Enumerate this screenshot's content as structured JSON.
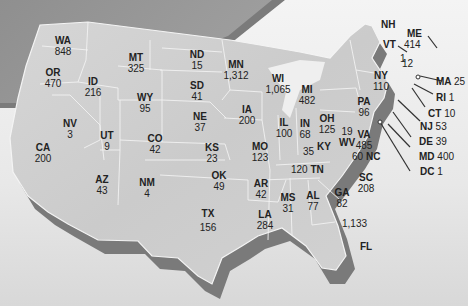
{
  "map": {
    "type": "US state choropleth-style labeled map",
    "states": [
      {
        "abbr": "WA",
        "value": "848"
      },
      {
        "abbr": "OR",
        "value": "470"
      },
      {
        "abbr": "CA",
        "value": "200"
      },
      {
        "abbr": "ID",
        "value": "216"
      },
      {
        "abbr": "NV",
        "value": "3"
      },
      {
        "abbr": "MT",
        "value": "325"
      },
      {
        "abbr": "WY",
        "value": "95"
      },
      {
        "abbr": "UT",
        "value": "9"
      },
      {
        "abbr": "AZ",
        "value": "43"
      },
      {
        "abbr": "CO",
        "value": "42"
      },
      {
        "abbr": "NM",
        "value": "4"
      },
      {
        "abbr": "ND",
        "value": "15"
      },
      {
        "abbr": "SD",
        "value": "41"
      },
      {
        "abbr": "NE",
        "value": "37"
      },
      {
        "abbr": "KS",
        "value": "23"
      },
      {
        "abbr": "OK",
        "value": "49"
      },
      {
        "abbr": "TX",
        "value": "156"
      },
      {
        "abbr": "MN",
        "value": "1,312"
      },
      {
        "abbr": "IA",
        "value": "200"
      },
      {
        "abbr": "MO",
        "value": "123"
      },
      {
        "abbr": "AR",
        "value": "42"
      },
      {
        "abbr": "LA",
        "value": "284"
      },
      {
        "abbr": "WI",
        "value": "1,065"
      },
      {
        "abbr": "IL",
        "value": "100"
      },
      {
        "abbr": "MI",
        "value": "482"
      },
      {
        "abbr": "IN",
        "value": "68"
      },
      {
        "abbr": "OH",
        "value": "125"
      },
      {
        "abbr": "KY",
        "value": "35"
      },
      {
        "abbr": "TN",
        "value": "120"
      },
      {
        "abbr": "MS",
        "value": "31"
      },
      {
        "abbr": "AL",
        "value": "77"
      },
      {
        "abbr": "GA",
        "value": "82"
      },
      {
        "abbr": "FL",
        "value": "1,133"
      },
      {
        "abbr": "SC",
        "value": "208"
      },
      {
        "abbr": "NC",
        "value": "60"
      },
      {
        "abbr": "VA",
        "value": "485"
      },
      {
        "abbr": "WV",
        "value": "19"
      },
      {
        "abbr": "PA",
        "value": "96"
      },
      {
        "abbr": "NY",
        "value": "110"
      },
      {
        "abbr": "VT",
        "value": "1"
      },
      {
        "abbr": "NH",
        "value": "12"
      },
      {
        "abbr": "ME",
        "value": "414"
      },
      {
        "abbr": "MA",
        "value": "25"
      },
      {
        "abbr": "RI",
        "value": "1"
      },
      {
        "abbr": "CT",
        "value": "10"
      },
      {
        "abbr": "NJ",
        "value": "53"
      },
      {
        "abbr": "DE",
        "value": "39"
      },
      {
        "abbr": "MD",
        "value": "400"
      },
      {
        "abbr": "DC",
        "value": "1"
      }
    ]
  }
}
